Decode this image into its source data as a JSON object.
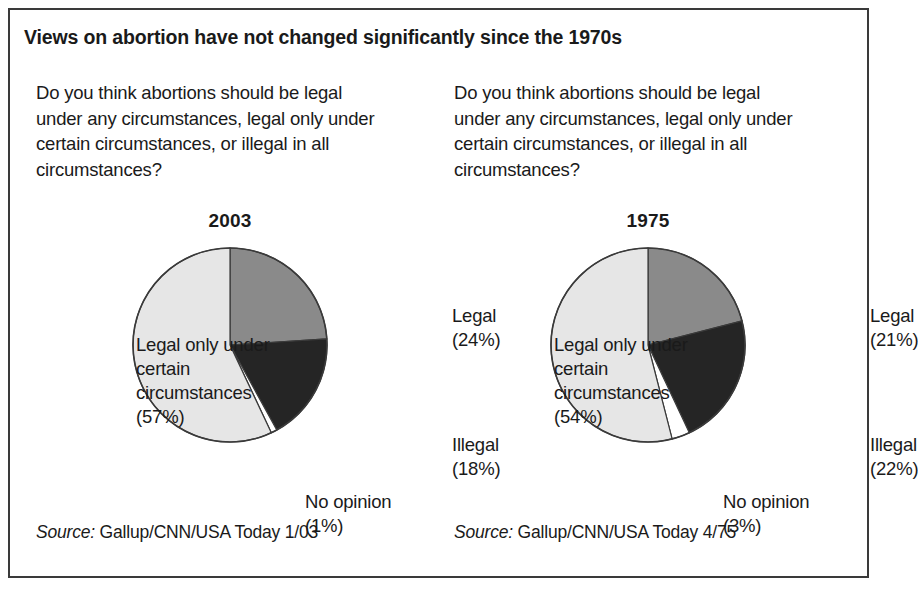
{
  "title": "Views on abortion have not changed significantly since the 1970s",
  "panels": [
    {
      "question": "Do you think abortions should be legal under any circumstances, legal only under certain circumstances, or illegal in all circumstances?",
      "year": "2003",
      "labels": {
        "legal": "Legal",
        "legal_pct": "(24%)",
        "illegal": "Illegal",
        "illegal_pct": "(18%)",
        "no_opinion": "No opinion",
        "no_opinion_pct": "(1%)",
        "certain": "Legal only under certain circumstances",
        "certain_pct": "(57%)"
      },
      "source_word": "Source:",
      "source_text": "Gallup/CNN/USA Today 1/03"
    },
    {
      "question": "Do you think abortions should be legal under any circumstances, legal only under certain circumstances, or illegal in all circumstances?",
      "year": "1975",
      "labels": {
        "legal": "Legal",
        "legal_pct": "(21%)",
        "illegal": "Illegal",
        "illegal_pct": "(22%)",
        "no_opinion": "No opinion",
        "no_opinion_pct": "(3%)",
        "certain": "Legal only under certain circumstances",
        "certain_pct": "(54%)"
      },
      "source_word": "Source:",
      "source_text": "Gallup/CNN/USA Today 4/75"
    }
  ],
  "colors": {
    "legal": "#8a8a8a",
    "illegal": "#252525",
    "no_opinion": "#ffffff",
    "certain": "#e6e6e6",
    "outline": "#3a3a3a",
    "text": "#1a1a1a",
    "frame": "#3a3a3a"
  },
  "chart_data": [
    {
      "type": "pie",
      "title": "2003",
      "labels": [
        "Legal",
        "Illegal",
        "No opinion",
        "Legal only under certain circumstances"
      ],
      "values": [
        24,
        18,
        1,
        57
      ],
      "unit": "percent",
      "start_angle_deg": 0,
      "direction": "clockwise",
      "colors": [
        "#8a8a8a",
        "#252525",
        "#ffffff",
        "#e6e6e6"
      ],
      "legend": "labels placed around pie",
      "source": "Source: Gallup/CNN/USA Today 1/03"
    },
    {
      "type": "pie",
      "title": "1975",
      "labels": [
        "Legal",
        "Illegal",
        "No opinion",
        "Legal only under certain circumstances"
      ],
      "values": [
        21,
        22,
        3,
        54
      ],
      "unit": "percent",
      "start_angle_deg": 0,
      "direction": "clockwise",
      "colors": [
        "#8a8a8a",
        "#252525",
        "#ffffff",
        "#e6e6e6"
      ],
      "legend": "labels placed around pie",
      "source": "Source: Gallup/CNN/USA Today 4/75"
    }
  ]
}
